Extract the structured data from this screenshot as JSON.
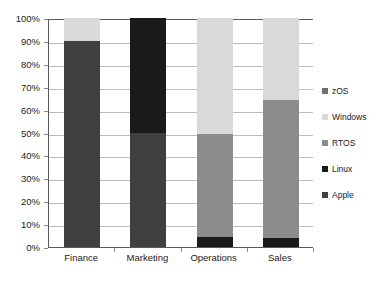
{
  "chart_data": {
    "type": "bar",
    "subtype": "stacked-100-percent",
    "title": "",
    "subtitle": "",
    "xlabel": "",
    "ylabel": "",
    "categories": [
      "Finance",
      "Marketing",
      "Operations",
      "Sales"
    ],
    "series": [
      {
        "name": "Apple",
        "color": "#404040",
        "values": [
          90,
          50,
          0,
          0
        ]
      },
      {
        "name": "Linux",
        "color": "#1a1a1a",
        "values": [
          0,
          50,
          4.5,
          4
        ]
      },
      {
        "name": "RTOS",
        "color": "#8c8c8c",
        "values": [
          0,
          0,
          45,
          60
        ]
      },
      {
        "name": "Windows",
        "color": "#d9d9d9",
        "values": [
          10,
          0,
          50.5,
          36
        ]
      },
      {
        "name": "zOS",
        "color": "#6e6e6e",
        "values": [
          0,
          0,
          0,
          0
        ]
      }
    ],
    "ylim": [
      0,
      100
    ],
    "ytick_values": [
      0,
      10,
      20,
      30,
      40,
      50,
      60,
      70,
      80,
      90,
      100
    ],
    "ytick_labels": [
      "0%",
      "10%",
      "20%",
      "30%",
      "40%",
      "50%",
      "60%",
      "70%",
      "80%",
      "90%",
      "100%"
    ],
    "grid": true,
    "grid_axis": "y",
    "legend_position": "right",
    "legend_order": [
      "zOS",
      "Windows",
      "RTOS",
      "Linux",
      "Apple"
    ]
  },
  "legend": {
    "items": [
      {
        "label": "zOS",
        "color": "#6e6e6e"
      },
      {
        "label": "Windows",
        "color": "#d9d9d9"
      },
      {
        "label": "RTOS",
        "color": "#8c8c8c"
      },
      {
        "label": "Linux",
        "color": "#1a1a1a"
      },
      {
        "label": "Apple",
        "color": "#404040"
      }
    ]
  },
  "axes": {
    "y_labels": [
      "100%",
      "90%",
      "80%",
      "70%",
      "60%",
      "50%",
      "40%",
      "30%",
      "20%",
      "10%",
      "0%"
    ],
    "x_labels": [
      "Finance",
      "Marketing",
      "Operations",
      "Sales"
    ]
  },
  "style": {
    "plot_border_color": "#5a5a5a",
    "gridline_color": "#bdbdbd",
    "background": "#ffffff",
    "text_color": "#1b1b1b"
  }
}
